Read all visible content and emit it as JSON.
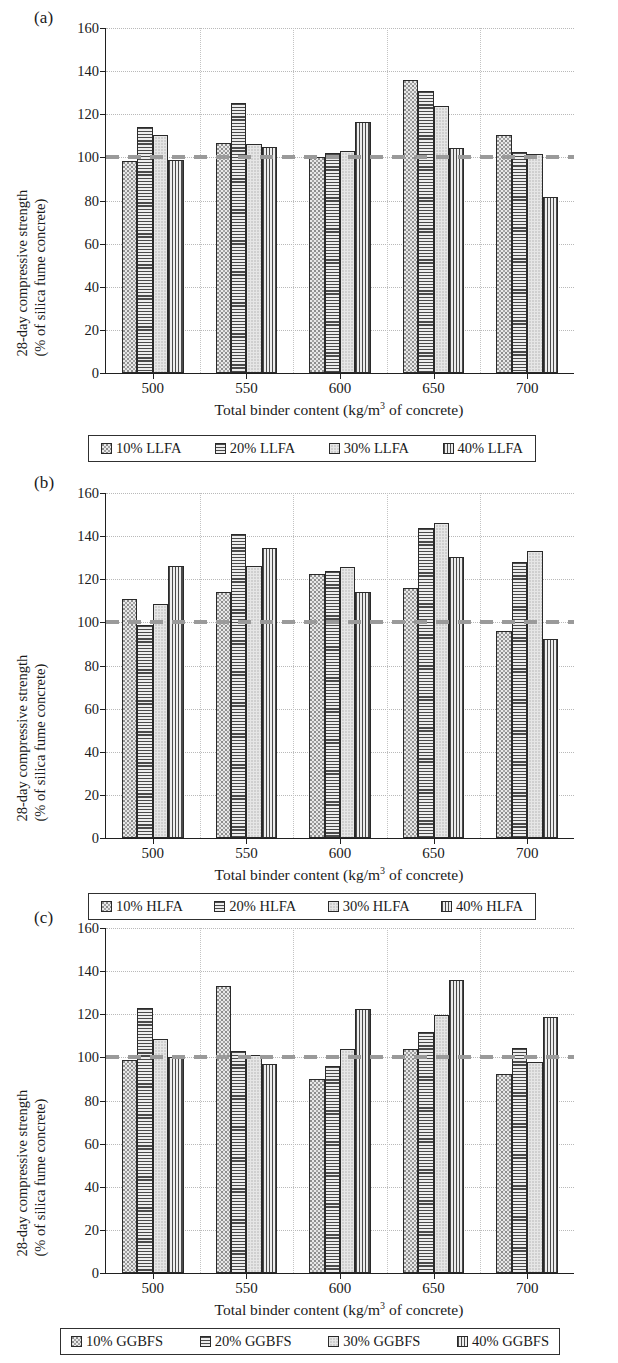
{
  "figure": {
    "axis_y_title_line1": "28-day compressive strength",
    "axis_y_title_line2": "(% of silica fume concrete)",
    "axis_x_title_pre": "Total binder content (kg/m",
    "axis_x_title_sup": "3",
    "axis_x_title_post": " of concrete)",
    "y_ticks": [
      "0",
      "20",
      "40",
      "60",
      "80",
      "100",
      "120",
      "140",
      "160"
    ],
    "x_ticks": [
      "500",
      "550",
      "600",
      "650",
      "700"
    ],
    "reference_value": 100,
    "reference_color": "#9a9a9a",
    "axis_color": "#202020",
    "grid_color": "#b9b9b9"
  },
  "panels": [
    {
      "label": "(a)",
      "legend": [
        {
          "text": "10% LLFA",
          "pattern": "dots"
        },
        {
          "text": "20% LLFA",
          "pattern": "horz"
        },
        {
          "text": "30% LLFA",
          "pattern": "solid"
        },
        {
          "text": "40% LLFA",
          "pattern": "vert"
        }
      ]
    },
    {
      "label": "(b)",
      "legend": [
        {
          "text": "10% HLFA",
          "pattern": "dots"
        },
        {
          "text": "20% HLFA",
          "pattern": "horz"
        },
        {
          "text": "30% HLFA",
          "pattern": "solid"
        },
        {
          "text": "40% HLFA",
          "pattern": "vert"
        }
      ]
    },
    {
      "label": "(c)",
      "legend": [
        {
          "text": "10% GGBFS",
          "pattern": "dots"
        },
        {
          "text": "20% GGBFS",
          "pattern": "horz"
        },
        {
          "text": "30% GGBFS",
          "pattern": "solid"
        },
        {
          "text": "40% GGBFS",
          "pattern": "vert"
        }
      ]
    }
  ],
  "chart_data": [
    {
      "type": "bar",
      "panel": "(a)",
      "title": "",
      "xlabel": "Total binder content (kg/m3 of concrete)",
      "ylabel": "28-day compressive strength (% of silica fume concrete)",
      "ylim": [
        0,
        160
      ],
      "ytick_step": 20,
      "grid": true,
      "legend_position": "below",
      "reference_line": 100,
      "categories": [
        "500",
        "550",
        "600",
        "650",
        "700"
      ],
      "series": [
        {
          "name": "10% LLFA",
          "values": [
            98.5,
            106.5,
            100.0,
            136.0,
            110.5
          ]
        },
        {
          "name": "20% LLFA",
          "values": [
            114.0,
            125.0,
            102.0,
            131.0,
            102.5
          ]
        },
        {
          "name": "30% LLFA",
          "values": [
            110.5,
            106.0,
            103.0,
            124.0,
            101.5
          ]
        },
        {
          "name": "40% LLFA",
          "values": [
            99.0,
            105.0,
            116.5,
            104.5,
            81.5
          ]
        }
      ]
    },
    {
      "type": "bar",
      "panel": "(b)",
      "title": "",
      "xlabel": "Total binder content (kg/m3 of concrete)",
      "ylabel": "28-day compressive strength (% of silica fume concrete)",
      "ylim": [
        0,
        160
      ],
      "ytick_step": 20,
      "grid": true,
      "legend_position": "below",
      "reference_line": 100,
      "categories": [
        "500",
        "550",
        "600",
        "650",
        "700"
      ],
      "series": [
        {
          "name": "10% HLFA",
          "values": [
            111.0,
            114.0,
            122.5,
            116.0,
            96.0
          ]
        },
        {
          "name": "20% HLFA",
          "values": [
            99.0,
            141.0,
            124.0,
            144.0,
            128.0
          ]
        },
        {
          "name": "30% HLFA",
          "values": [
            108.5,
            126.0,
            125.5,
            146.0,
            133.0
          ]
        },
        {
          "name": "40% HLFA",
          "values": [
            126.0,
            134.5,
            114.0,
            130.5,
            92.5
          ]
        }
      ]
    },
    {
      "type": "bar",
      "panel": "(c)",
      "title": "",
      "xlabel": "Total binder content (kg/m3 of concrete)",
      "ylabel": "28-day compressive strength (% of silica fume concrete)",
      "ylim": [
        0,
        160
      ],
      "ytick_step": 20,
      "grid": true,
      "legend_position": "below",
      "reference_line": 100,
      "categories": [
        "500",
        "550",
        "600",
        "650",
        "700"
      ],
      "series": [
        {
          "name": "10% GGBFS",
          "values": [
            99.0,
            133.0,
            90.0,
            104.0,
            92.5
          ]
        },
        {
          "name": "20% GGBFS",
          "values": [
            123.0,
            103.0,
            96.0,
            112.0,
            104.5
          ]
        },
        {
          "name": "30% GGBFS",
          "values": [
            108.5,
            101.0,
            104.0,
            119.5,
            98.0
          ]
        },
        {
          "name": "40% GGBFS",
          "values": [
            100.0,
            97.0,
            122.5,
            136.0,
            118.5
          ]
        }
      ]
    }
  ]
}
